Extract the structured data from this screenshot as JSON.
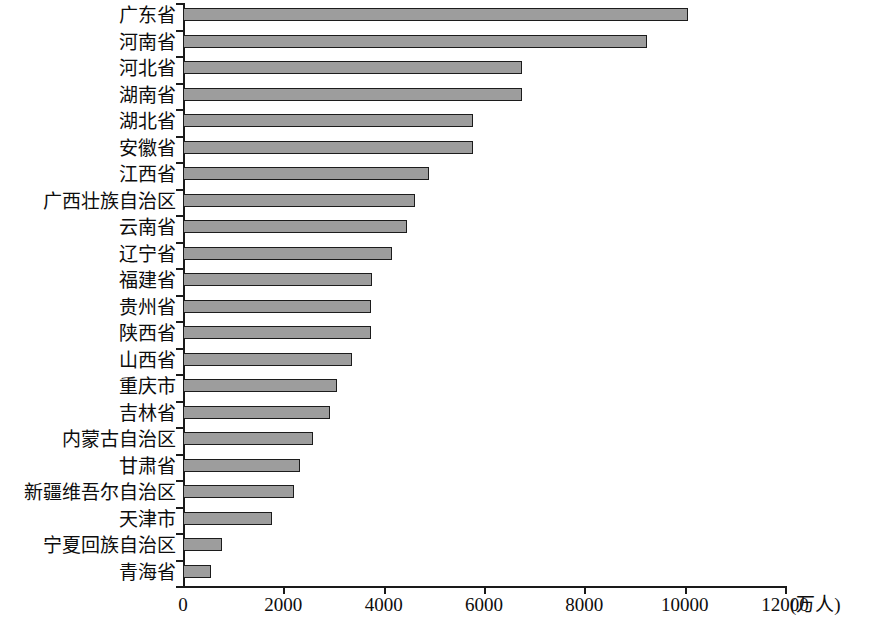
{
  "chart_data": {
    "type": "bar",
    "orientation": "horizontal",
    "title": "",
    "xlabel": "(万人)",
    "ylabel": "",
    "xlim": [
      0,
      12000
    ],
    "xticks": [
      "0",
      "2000",
      "4000",
      "6000",
      "8000",
      "10000",
      "12000"
    ],
    "xtick_values": [
      0,
      2000,
      4000,
      6000,
      8000,
      10000,
      12000
    ],
    "unit_label": "(万人)",
    "grid": false,
    "legend": false,
    "bar_color": "#9d9d9d",
    "bar_border_color": "#1c1c1c",
    "axis_color": "#1a1a1a",
    "categories": [
      "广东省",
      "河南省",
      "河北省",
      "湖南省",
      "湖北省",
      "安徽省",
      "江西省",
      "广西壮族自治区",
      "云南省",
      "辽宁省",
      "福建省",
      "贵州省",
      "陕西省",
      "山西省",
      "重庆市",
      "吉林省",
      "内蒙古自治区",
      "甘肃省",
      "新疆维吾尔自治区",
      "天津市",
      "宁夏回族自治区",
      "青海省"
    ],
    "values": [
      10060,
      9250,
      6760,
      6760,
      5790,
      5780,
      4900,
      4620,
      4460,
      4160,
      3760,
      3740,
      3740,
      3370,
      3070,
      2930,
      2590,
      2330,
      2220,
      1770,
      780,
      560
    ]
  }
}
